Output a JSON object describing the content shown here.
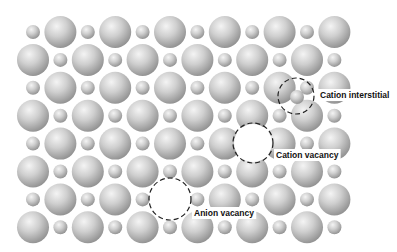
{
  "lattice": {
    "rows": 8,
    "cols": 12,
    "origin_x": 33,
    "origin_y": 32,
    "pitch_x": 27.4,
    "pitch_y": 27.9,
    "anion_radius": 16,
    "cation_radius": 7,
    "odd_rows_start_with": "cation",
    "colors": {
      "ion_light": "#f2f2f2",
      "ion_mid": "#c4c4c4",
      "ion_dark": "#8e8e8e"
    }
  },
  "defects": [
    {
      "type": "cation-interstitial",
      "label": "Cation interstitial",
      "circle": {
        "cx": 296,
        "cy": 96,
        "r": 18
      },
      "extra_ion": {
        "cx": 297,
        "cy": 97,
        "r": 7
      },
      "label_pos": {
        "x": 320,
        "y": 98
      }
    },
    {
      "type": "cation-vacancy",
      "label": "Cation vacancy",
      "circle": {
        "cx": 253,
        "cy": 143,
        "r": 20
      },
      "missing": {
        "row": 4,
        "col": 8
      },
      "label_pos": {
        "x": 276,
        "y": 158
      }
    },
    {
      "type": "anion-vacancy",
      "label": "Anion vacancy",
      "circle": {
        "cx": 170,
        "cy": 199,
        "r": 21
      },
      "missing": {
        "row": 6,
        "col": 5
      },
      "label_pos": {
        "x": 194,
        "y": 216
      }
    }
  ]
}
